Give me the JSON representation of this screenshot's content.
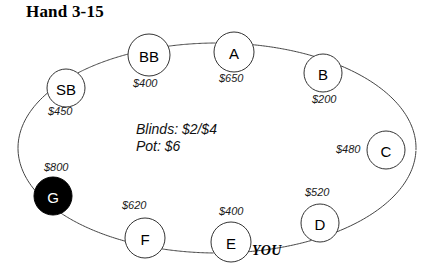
{
  "title": "Hand 3-15",
  "center_info": {
    "blinds_line": "Blinds: $2/$4",
    "pot_line": "Pot: $6"
  },
  "hero_marker": "YOU",
  "colors": {
    "table_outline": "#444444",
    "seat_outline": "#333333",
    "seat_fill": "#ffffff",
    "hero_fill": "#000000",
    "hero_text": "#ffffff",
    "text": "#000000",
    "background": "#ffffff"
  },
  "seats": [
    {
      "id": "sb",
      "label": "SB",
      "stack": "$450",
      "cx": 66,
      "cy": 88,
      "r": 19,
      "filled": false,
      "stack_x": 48,
      "stack_y": 105
    },
    {
      "id": "bb",
      "label": "BB",
      "stack": "$400",
      "cx": 149,
      "cy": 55,
      "r": 21,
      "filled": false,
      "stack_x": 133,
      "stack_y": 77
    },
    {
      "id": "a",
      "label": "A",
      "stack": "$650",
      "cx": 234,
      "cy": 52,
      "r": 20,
      "filled": false,
      "stack_x": 219,
      "stack_y": 72
    },
    {
      "id": "b",
      "label": "B",
      "stack": "$200",
      "cx": 323,
      "cy": 73,
      "r": 19,
      "filled": false,
      "stack_x": 312,
      "stack_y": 93
    },
    {
      "id": "c",
      "label": "C",
      "stack": "$480",
      "cx": 386,
      "cy": 150,
      "r": 19,
      "filled": false,
      "stack_x": 336,
      "stack_y": 143
    },
    {
      "id": "d",
      "label": "D",
      "stack": "$520",
      "cx": 320,
      "cy": 223,
      "r": 19,
      "filled": false,
      "stack_x": 305,
      "stack_y": 186
    },
    {
      "id": "e",
      "label": "E",
      "stack": "$400",
      "cx": 231,
      "cy": 242,
      "r": 20,
      "filled": false,
      "stack_x": 219,
      "stack_y": 205
    },
    {
      "id": "f",
      "label": "F",
      "stack": "$620",
      "cx": 145,
      "cy": 238,
      "r": 20,
      "filled": false,
      "stack_x": 122,
      "stack_y": 199
    },
    {
      "id": "g",
      "label": "G",
      "stack": "$800",
      "cx": 53,
      "cy": 196,
      "r": 19,
      "filled": true,
      "stack_x": 44,
      "stack_y": 161
    }
  ],
  "table_shape": {
    "cx": 217,
    "cy": 148,
    "rx": 199,
    "ry": 105
  }
}
